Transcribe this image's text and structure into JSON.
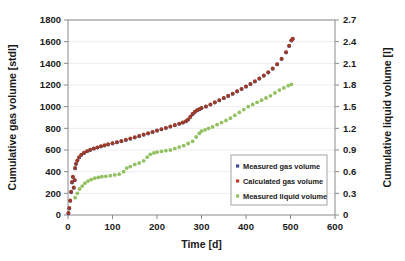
{
  "chart_data": {
    "type": "scatter",
    "title": "",
    "xlabel": "Time [d]",
    "ylabel": "Cumulative gas volume [stdl]",
    "y2label": "Cumulative liquid volume [l]",
    "xlim": [
      0,
      600
    ],
    "ylim": [
      0,
      1800
    ],
    "y2lim": [
      0,
      2.7
    ],
    "xticks": [
      0,
      100,
      200,
      300,
      400,
      500,
      600
    ],
    "xtick_labels": [
      "0",
      "100",
      "200",
      "300",
      "400",
      "500",
      "600"
    ],
    "yticks": [
      0,
      200,
      400,
      600,
      800,
      1000,
      1200,
      1400,
      1600,
      1800
    ],
    "ytick_labels": [
      "0",
      "200",
      "400",
      "600",
      "800",
      "1000",
      "1200",
      "1400",
      "1600",
      "1800"
    ],
    "y2ticks": [
      0,
      0.3,
      0.6,
      0.9,
      1.2,
      1.5,
      1.8,
      2.1,
      2.4,
      2.7
    ],
    "y2tick_labels": [
      "0",
      "0.3",
      "0.6",
      "0.9",
      "1.2",
      "1.5",
      "1.8",
      "2.1",
      "2.4",
      "2.7"
    ],
    "grid": "horizontal",
    "legend_position": "inside-lower-right",
    "series": [
      {
        "name": "Measured gas volume",
        "color": "#3f4d8c",
        "axis": "left",
        "marker": "dot",
        "points": [
          [
            1,
            15
          ],
          [
            3,
            60
          ],
          [
            5,
            130
          ],
          [
            7,
            210
          ],
          [
            9,
            300
          ],
          [
            11,
            350
          ],
          [
            13,
            250
          ],
          [
            15,
            320
          ],
          [
            16,
            430
          ],
          [
            18,
            470
          ],
          [
            21,
            500
          ],
          [
            25,
            530
          ],
          [
            30,
            555
          ],
          [
            36,
            572
          ],
          [
            43,
            588
          ],
          [
            50,
            600
          ],
          [
            58,
            612
          ],
          [
            66,
            622
          ],
          [
            74,
            632
          ],
          [
            82,
            641
          ],
          [
            90,
            650
          ],
          [
            100,
            660
          ],
          [
            110,
            670
          ],
          [
            120,
            680
          ],
          [
            130,
            692
          ],
          [
            140,
            703
          ],
          [
            150,
            715
          ],
          [
            160,
            727
          ],
          [
            170,
            740
          ],
          [
            180,
            752
          ],
          [
            190,
            765
          ],
          [
            200,
            778
          ],
          [
            210,
            790
          ],
          [
            220,
            802
          ],
          [
            230,
            815
          ],
          [
            240,
            828
          ],
          [
            250,
            841
          ],
          [
            258,
            852
          ],
          [
            265,
            864
          ],
          [
            270,
            880
          ],
          [
            275,
            905
          ],
          [
            280,
            930
          ],
          [
            285,
            950
          ],
          [
            290,
            965
          ],
          [
            295,
            975
          ],
          [
            300,
            985
          ],
          [
            310,
            1000
          ],
          [
            320,
            1018
          ],
          [
            330,
            1038
          ],
          [
            340,
            1058
          ],
          [
            350,
            1078
          ],
          [
            360,
            1098
          ],
          [
            370,
            1118
          ],
          [
            380,
            1140
          ],
          [
            390,
            1162
          ],
          [
            400,
            1185
          ],
          [
            410,
            1208
          ],
          [
            420,
            1232
          ],
          [
            430,
            1258
          ],
          [
            440,
            1285
          ],
          [
            450,
            1315
          ],
          [
            460,
            1350
          ],
          [
            470,
            1390
          ],
          [
            480,
            1440
          ],
          [
            490,
            1500
          ],
          [
            497,
            1560
          ],
          [
            502,
            1610
          ],
          [
            505,
            1625
          ]
        ]
      },
      {
        "name": "Calculated gas volume",
        "color": "#9e3b26",
        "axis": "left",
        "marker": "dot",
        "points": [
          [
            1,
            20
          ],
          [
            3,
            65
          ],
          [
            5,
            135
          ],
          [
            7,
            215
          ],
          [
            9,
            305
          ],
          [
            11,
            355
          ],
          [
            13,
            255
          ],
          [
            15,
            325
          ],
          [
            16,
            435
          ],
          [
            18,
            475
          ],
          [
            21,
            505
          ],
          [
            25,
            535
          ],
          [
            30,
            558
          ],
          [
            36,
            575
          ],
          [
            43,
            590
          ],
          [
            50,
            603
          ],
          [
            58,
            615
          ],
          [
            66,
            625
          ],
          [
            74,
            635
          ],
          [
            82,
            644
          ],
          [
            90,
            653
          ],
          [
            100,
            663
          ],
          [
            110,
            673
          ],
          [
            120,
            683
          ],
          [
            130,
            695
          ],
          [
            140,
            706
          ],
          [
            150,
            718
          ],
          [
            160,
            730
          ],
          [
            170,
            743
          ],
          [
            180,
            755
          ],
          [
            190,
            768
          ],
          [
            200,
            781
          ],
          [
            210,
            793
          ],
          [
            220,
            805
          ],
          [
            230,
            818
          ],
          [
            240,
            831
          ],
          [
            250,
            844
          ],
          [
            258,
            855
          ],
          [
            265,
            867
          ],
          [
            270,
            883
          ],
          [
            275,
            908
          ],
          [
            280,
            933
          ],
          [
            285,
            953
          ],
          [
            290,
            968
          ],
          [
            295,
            978
          ],
          [
            300,
            988
          ],
          [
            310,
            1003
          ],
          [
            320,
            1021
          ],
          [
            330,
            1041
          ],
          [
            340,
            1061
          ],
          [
            350,
            1081
          ],
          [
            360,
            1101
          ],
          [
            370,
            1121
          ],
          [
            380,
            1143
          ],
          [
            390,
            1165
          ],
          [
            400,
            1188
          ],
          [
            410,
            1211
          ],
          [
            420,
            1235
          ],
          [
            430,
            1261
          ],
          [
            440,
            1288
          ],
          [
            450,
            1318
          ],
          [
            460,
            1353
          ],
          [
            470,
            1393
          ],
          [
            480,
            1443
          ],
          [
            490,
            1503
          ],
          [
            497,
            1563
          ],
          [
            502,
            1613
          ],
          [
            505,
            1628
          ]
        ]
      },
      {
        "name": "Measured liquid volume",
        "color": "#93c061",
        "axis": "right",
        "marker": "dot",
        "points": [
          [
            16,
            0.24
          ],
          [
            21,
            0.3
          ],
          [
            26,
            0.36
          ],
          [
            32,
            0.4
          ],
          [
            38,
            0.44
          ],
          [
            45,
            0.47
          ],
          [
            52,
            0.49
          ],
          [
            60,
            0.51
          ],
          [
            68,
            0.52
          ],
          [
            76,
            0.53
          ],
          [
            85,
            0.535
          ],
          [
            95,
            0.545
          ],
          [
            105,
            0.555
          ],
          [
            115,
            0.565
          ],
          [
            125,
            0.6
          ],
          [
            132,
            0.65
          ],
          [
            140,
            0.67
          ],
          [
            150,
            0.7
          ],
          [
            160,
            0.72
          ],
          [
            170,
            0.75
          ],
          [
            178,
            0.8
          ],
          [
            185,
            0.84
          ],
          [
            193,
            0.86
          ],
          [
            200,
            0.87
          ],
          [
            210,
            0.88
          ],
          [
            220,
            0.89
          ],
          [
            230,
            0.9
          ],
          [
            240,
            0.92
          ],
          [
            250,
            0.94
          ],
          [
            260,
            0.96
          ],
          [
            270,
            0.99
          ],
          [
            280,
            1.02
          ],
          [
            288,
            1.08
          ],
          [
            295,
            1.13
          ],
          [
            300,
            1.16
          ],
          [
            308,
            1.18
          ],
          [
            316,
            1.2
          ],
          [
            325,
            1.22
          ],
          [
            335,
            1.25
          ],
          [
            345,
            1.28
          ],
          [
            355,
            1.31
          ],
          [
            365,
            1.34
          ],
          [
            375,
            1.38
          ],
          [
            385,
            1.42
          ],
          [
            395,
            1.46
          ],
          [
            405,
            1.5
          ],
          [
            415,
            1.53
          ],
          [
            425,
            1.56
          ],
          [
            435,
            1.59
          ],
          [
            445,
            1.62
          ],
          [
            455,
            1.65
          ],
          [
            465,
            1.69
          ],
          [
            475,
            1.73
          ],
          [
            485,
            1.76
          ],
          [
            495,
            1.79
          ],
          [
            502,
            1.81
          ]
        ]
      }
    ]
  },
  "legend": {
    "items": [
      {
        "label": "Measured gas volume",
        "color": "#3f4d8c"
      },
      {
        "label": "Calculated gas volume",
        "color": "#c0392b"
      },
      {
        "label": "Measured liquid volume",
        "color": "#93c061"
      }
    ]
  },
  "axes": {
    "x_title": "Time [d]",
    "y_left_title": "Cumulative gas volume [stdl]",
    "y_right_title": "Cumulative liquid volume [l]"
  }
}
